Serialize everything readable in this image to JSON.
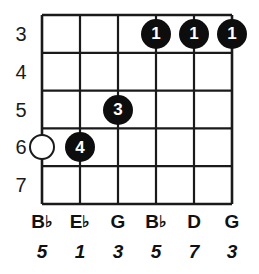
{
  "diagram": {
    "type": "guitar-chord-diagram",
    "title": "",
    "string_count": 6,
    "fret_rows": 5,
    "geometry": {
      "grid_left": 42,
      "grid_top": 15,
      "grid_right": 232,
      "grid_bottom": 204,
      "string_spacing": 38,
      "fret_spacing": 37.8,
      "string_x": [
        42,
        80,
        118,
        156,
        194,
        232
      ],
      "fret_line_y": [
        15,
        52.8,
        90.6,
        128.4,
        166.2,
        204
      ],
      "dot_radius": 15,
      "open_circle_radius": 13
    },
    "colors": {
      "background": "#ffffff",
      "grid_line": "#1a1a1a",
      "dot_fill": "#0d0d0d",
      "dot_text": "#ffffff",
      "open_dot_fill": "#ffffff",
      "open_dot_stroke": "#1a1a1a",
      "label_text": "#111111",
      "fret_number_text": "#1a1a1a"
    }
  },
  "fret_numbers": [
    {
      "label": "3",
      "row": 0
    },
    {
      "label": "4",
      "row": 1
    },
    {
      "label": "5",
      "row": 2
    },
    {
      "label": "6",
      "row": 3
    },
    {
      "label": "7",
      "row": 4
    }
  ],
  "finger_dots": [
    {
      "label": "1",
      "string": 4,
      "fret_row": 0,
      "type": "filled"
    },
    {
      "label": "1",
      "string": 5,
      "fret_row": 0,
      "type": "filled"
    },
    {
      "label": "1",
      "string": 6,
      "fret_row": 0,
      "type": "filled"
    },
    {
      "label": "3",
      "string": 3,
      "fret_row": 2,
      "type": "filled"
    },
    {
      "label": "",
      "string": 1,
      "fret_row": 3,
      "type": "open"
    },
    {
      "label": "4",
      "string": 2,
      "fret_row": 3,
      "type": "filled"
    }
  ],
  "note_names": [
    {
      "letter": "B",
      "accidental": "♭",
      "string": 1
    },
    {
      "letter": "E",
      "accidental": "♭",
      "string": 2
    },
    {
      "letter": "G",
      "accidental": "",
      "string": 3
    },
    {
      "letter": "B",
      "accidental": "♭",
      "string": 4
    },
    {
      "letter": "D",
      "accidental": "",
      "string": 5
    },
    {
      "letter": "G",
      "accidental": "",
      "string": 6
    }
  ],
  "intervals": [
    {
      "label": "5",
      "string": 1
    },
    {
      "label": "1",
      "string": 2
    },
    {
      "label": "3",
      "string": 3
    },
    {
      "label": "5",
      "string": 4
    },
    {
      "label": "7",
      "string": 5
    },
    {
      "label": "3",
      "string": 6
    }
  ]
}
